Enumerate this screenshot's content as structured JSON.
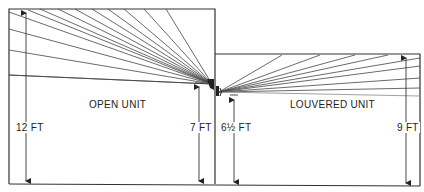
{
  "diagram": {
    "title": "",
    "rooms": [
      {
        "id": "open",
        "label": "OPEN UNIT",
        "ceiling_height": "12 FT",
        "unit_height": "7 FT"
      },
      {
        "id": "louvered",
        "label": "LOUVERED UNIT",
        "ceiling_height": "9 FT",
        "unit_height": "6½ FT"
      }
    ],
    "labels": {
      "open_unit": "OPEN UNIT",
      "louvered_unit": "LOUVERED UNIT",
      "dim_12ft": "12 FT",
      "dim_7ft": "7 FT",
      "dim_6_5ft": "6½ FT",
      "dim_9ft": "9 FT"
    },
    "colors": {
      "line": "#222222",
      "background": "#ffffff"
    }
  }
}
